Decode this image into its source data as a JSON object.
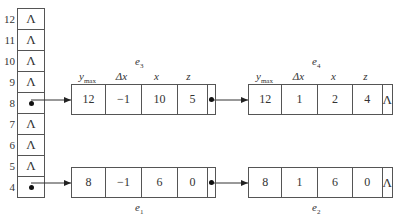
{
  "array": {
    "rows": [
      {
        "index": "12",
        "value": "Λ",
        "pointer": false
      },
      {
        "index": "11",
        "value": "Λ",
        "pointer": false
      },
      {
        "index": "10",
        "value": "Λ",
        "pointer": false
      },
      {
        "index": "9",
        "value": "Λ",
        "pointer": false
      },
      {
        "index": "8",
        "value": "",
        "pointer": true
      },
      {
        "index": "7",
        "value": "Λ",
        "pointer": false
      },
      {
        "index": "6",
        "value": "Λ",
        "pointer": false
      },
      {
        "index": "5",
        "value": "Λ",
        "pointer": false
      },
      {
        "index": "4",
        "value": "",
        "pointer": true
      }
    ]
  },
  "headers": {
    "ymax": "y",
    "ymax_sub": "max",
    "dx": "Δx",
    "x": "x",
    "z": "z"
  },
  "nodes": {
    "e3": {
      "label": "e",
      "sub": "3",
      "ymax": "12",
      "dx": "−1",
      "x": "10",
      "z": "5",
      "next": "pointer"
    },
    "e4": {
      "label": "e",
      "sub": "4",
      "ymax": "12",
      "dx": "1",
      "x": "2",
      "z": "4",
      "next": "Λ"
    },
    "e1": {
      "label": "e",
      "sub": "1",
      "ymax": "8",
      "dx": "−1",
      "x": "6",
      "z": "0",
      "next": "pointer"
    },
    "e2": {
      "label": "e",
      "sub": "2",
      "ymax": "8",
      "dx": "1",
      "x": "6",
      "z": "0",
      "next": "Λ"
    }
  }
}
